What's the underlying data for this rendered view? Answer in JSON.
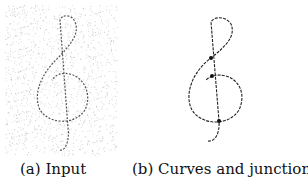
{
  "figure": {
    "panels": [
      {
        "id": "a",
        "label": "(a) Input",
        "description": "Noisy scan of a hand-drawn treble clef"
      },
      {
        "id": "b",
        "label": "(b) Curves and junctions",
        "description": "Extracted curves with junction points marked"
      }
    ],
    "junctions": [
      {
        "x": 57,
        "y": 58
      },
      {
        "x": 58,
        "y": 76
      },
      {
        "x": 65,
        "y": 121
      }
    ]
  }
}
